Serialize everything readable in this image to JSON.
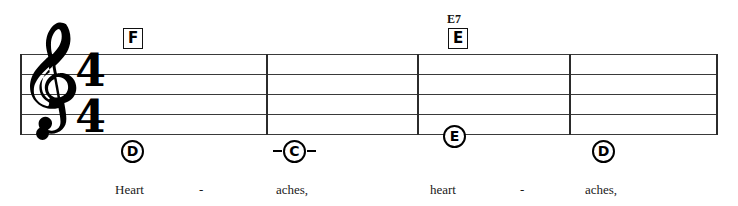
{
  "sheet": {
    "clef": "treble-clef",
    "time_signature": {
      "numerator": "4",
      "denominator": "4"
    }
  },
  "chords": [
    {
      "name": "chord-f",
      "label": "F",
      "superscript": "",
      "left": 123,
      "top": 28
    },
    {
      "name": "chord-e7",
      "label": "E",
      "superscript": "E7",
      "left": 448,
      "top": 28,
      "sup_left": 447,
      "sup_top": 13
    }
  ],
  "notes": [
    {
      "name": "note-d-1",
      "label": "D",
      "left": 121,
      "top": 140,
      "dash_left": false,
      "dash_right": false
    },
    {
      "name": "note-c",
      "label": "C",
      "left": 283,
      "top": 140,
      "dash_left": true,
      "dash_right": true
    },
    {
      "name": "note-e",
      "label": "E",
      "left": 443,
      "top": 125,
      "dash_left": false,
      "dash_right": false
    },
    {
      "name": "note-d-2",
      "label": "D",
      "left": 592,
      "top": 140,
      "dash_left": false,
      "dash_right": false
    }
  ],
  "lyrics": [
    {
      "name": "lyric-heart-1",
      "text": "Heart",
      "left": 115,
      "top": 182
    },
    {
      "name": "lyric-hyphen-1",
      "text": "-",
      "left": 199,
      "top": 182
    },
    {
      "name": "lyric-aches-1",
      "text": "aches,",
      "left": 276,
      "top": 182
    },
    {
      "name": "lyric-heart-2",
      "text": "heart",
      "left": 430,
      "top": 182
    },
    {
      "name": "lyric-hyphen-2",
      "text": "-",
      "left": 520,
      "top": 182
    },
    {
      "name": "lyric-aches-2",
      "text": "aches,",
      "left": 585,
      "top": 182
    }
  ],
  "barlines": [
    266,
    417,
    569
  ],
  "colors": {
    "ink": "#000000",
    "staff_line": "#3a3a3a",
    "paper": "#ffffff"
  }
}
